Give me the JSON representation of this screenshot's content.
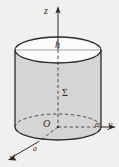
{
  "figure": {
    "type": "3d-diagram",
    "background_color": "#f1f0ee",
    "body_fill_color": "#d6d5d3",
    "top_face_fill_color": "#ffffff",
    "stroke_color": "#2b2b2b",
    "labels": {
      "z_axis": "z",
      "y_axis": "y",
      "x_axis": "x",
      "height": "h",
      "surface": "Σ",
      "origin": "O",
      "radius_y": "a",
      "radius_x": "a"
    },
    "geometry": {
      "axis_x_px": 58,
      "top_ellipse_center_y_px": 50,
      "bottom_ellipse_center_y_px": 127,
      "ellipse_rx_px": 43,
      "ellipse_ry_px": 13,
      "z_arrow_tip_y_px": 7,
      "y_arrow_tip_x_px": 115,
      "x_arrow_tip_px": [
        9,
        158
      ]
    }
  }
}
